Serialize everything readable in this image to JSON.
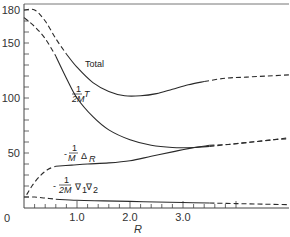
{
  "chart_data": {
    "type": "line",
    "title": "",
    "xlabel": "R",
    "ylabel": "",
    "xlim": [
      0,
      5.0
    ],
    "ylim": [
      0,
      180
    ],
    "grid": false,
    "legend": "inline labels",
    "x_ticks": [
      {
        "value": 0,
        "label": "0"
      },
      {
        "value": 1.0,
        "label": "1.0"
      },
      {
        "value": 2.0,
        "label": "2.0"
      },
      {
        "value": 3.0,
        "label": "3.0"
      }
    ],
    "y_ticks": [
      {
        "value": 50,
        "label": "50"
      },
      {
        "value": 100,
        "label": "100"
      },
      {
        "value": 150,
        "label": "150"
      },
      {
        "value": 180,
        "label": "180"
      }
    ],
    "x_minor_step": 0.2,
    "y_minor_step": 10,
    "series": [
      {
        "name": "Total",
        "label": "Total",
        "solid": [
          [
            0.8,
            140
          ],
          [
            1.0,
            128
          ],
          [
            1.3,
            114
          ],
          [
            1.6,
            106
          ],
          [
            1.9,
            102
          ],
          [
            2.2,
            102
          ],
          [
            2.5,
            104
          ],
          [
            2.8,
            108
          ],
          [
            3.1,
            112
          ],
          [
            3.4,
            115
          ]
        ],
        "dashed": [
          [
            0.0,
            180
          ],
          [
            0.2,
            180
          ],
          [
            0.4,
            170
          ],
          [
            0.6,
            154
          ],
          [
            0.8,
            140
          ]
        ],
        "dashed_tail": [
          [
            3.4,
            115
          ],
          [
            3.8,
            118
          ],
          [
            4.2,
            119
          ],
          [
            4.6,
            120
          ],
          [
            5.0,
            121
          ]
        ]
      },
      {
        "name": "1/2M T",
        "label": "1/2M T",
        "solid": [
          [
            0.6,
            138
          ],
          [
            0.8,
            118
          ],
          [
            1.0,
            100
          ],
          [
            1.3,
            83
          ],
          [
            1.6,
            71
          ],
          [
            2.0,
            62
          ],
          [
            2.4,
            57
          ],
          [
            2.8,
            55
          ],
          [
            3.2,
            55
          ],
          [
            3.5,
            56
          ]
        ],
        "dashed": [
          [
            0.0,
            173
          ],
          [
            0.2,
            165
          ],
          [
            0.4,
            154
          ],
          [
            0.6,
            138
          ]
        ],
        "dashed_tail": [
          [
            3.5,
            56
          ],
          [
            3.9,
            58
          ],
          [
            4.3,
            60
          ],
          [
            4.7,
            62
          ],
          [
            5.0,
            63
          ]
        ]
      },
      {
        "name": "-1/M Δ_R",
        "label": "-1/M Δ_R",
        "solid": [
          [
            0.6,
            38
          ],
          [
            0.9,
            39
          ],
          [
            1.2,
            40
          ],
          [
            1.6,
            41
          ],
          [
            2.0,
            43
          ],
          [
            2.4,
            47
          ],
          [
            2.8,
            51
          ],
          [
            3.1,
            54
          ],
          [
            3.5,
            57
          ]
        ],
        "dashed": [
          [
            0.05,
            12
          ],
          [
            0.15,
            20
          ],
          [
            0.3,
            29
          ],
          [
            0.45,
            35
          ],
          [
            0.6,
            38
          ]
        ],
        "dashed_tail": [
          [
            3.5,
            57
          ],
          [
            3.9,
            58
          ],
          [
            4.3,
            60
          ],
          [
            4.7,
            62
          ],
          [
            5.0,
            64
          ]
        ]
      },
      {
        "name": "-1/2M ∇1·∇2",
        "label": "-1/2M ∇1 ∇2",
        "solid": [
          [
            0.6,
            8
          ],
          [
            1.0,
            7
          ],
          [
            1.5,
            6.5
          ],
          [
            2.0,
            6
          ],
          [
            2.5,
            5.5
          ],
          [
            3.0,
            5
          ],
          [
            3.5,
            4.5
          ]
        ],
        "dashed": [
          [
            0.0,
            10
          ],
          [
            0.2,
            10
          ],
          [
            0.4,
            9
          ],
          [
            0.6,
            8
          ]
        ],
        "dashed_tail": [
          [
            3.5,
            4.5
          ],
          [
            4.0,
            4
          ],
          [
            4.5,
            3.5
          ],
          [
            5.0,
            3
          ]
        ]
      }
    ],
    "annotations": [
      {
        "text": "Total",
        "x": 1.15,
        "y": 127
      },
      {
        "text": "1",
        "x": 0.98,
        "y": 104,
        "role": "numerator"
      },
      {
        "text": "2M",
        "x": 0.93,
        "y": 94,
        "role": "denominator"
      },
      {
        "text": "T",
        "x": 1.17,
        "y": 97,
        "role": "superscript"
      },
      {
        "text": "-",
        "x": 0.78,
        "y": 45
      },
      {
        "text": "1",
        "x": 0.88,
        "y": 52,
        "role": "numerator"
      },
      {
        "text": "M",
        "x": 0.85,
        "y": 42,
        "role": "denominator"
      },
      {
        "text": "Δ",
        "x": 1.05,
        "y": 44
      },
      {
        "text": "R",
        "x": 1.2,
        "y": 42,
        "role": "subscript"
      },
      {
        "text": "-",
        "x": 0.6,
        "y": 18
      },
      {
        "text": "1",
        "x": 0.78,
        "y": 25,
        "role": "numerator"
      },
      {
        "text": "2M",
        "x": 0.68,
        "y": 14,
        "role": "denominator"
      },
      {
        "text": "∇",
        "x": 1.0,
        "y": 17
      },
      {
        "text": "1",
        "x": 1.12,
        "y": 14,
        "role": "subscript"
      },
      {
        "text": "∇",
        "x": 1.22,
        "y": 17
      },
      {
        "text": "2",
        "x": 1.35,
        "y": 14,
        "role": "subscript"
      }
    ]
  },
  "axis": {
    "x_title": "R",
    "origin_label": "0"
  },
  "labels": {
    "total": "Total",
    "kinetic_num": "1",
    "kinetic_den": "2M",
    "kinetic_sup": "T",
    "delta_minus": "-",
    "delta_num": "1",
    "delta_den": "M",
    "delta_sym": "Δ",
    "delta_sub": "R",
    "grad_minus": "-",
    "grad_num": "1",
    "grad_den": "2M",
    "grad_sym1": "∇",
    "grad_sub1": "1",
    "grad_sym2": "∇",
    "grad_sub2": "2"
  },
  "colors": {
    "line": "#2a2a2a",
    "frame": "#555555",
    "text": "#333333"
  }
}
